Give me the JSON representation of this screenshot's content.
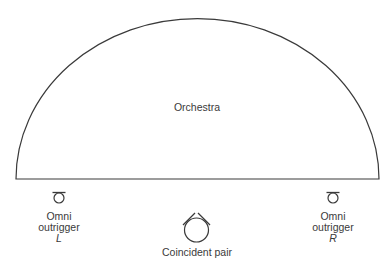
{
  "diagram": {
    "stage": {
      "label": "Orchestra",
      "shape": "semicircle"
    },
    "microphones": {
      "left_outrigger": {
        "line1": "Omni",
        "line2": "outrigger",
        "side": "L",
        "type": "omni-icon"
      },
      "right_outrigger": {
        "line1": "Omni",
        "line2": "outrigger",
        "side": "R",
        "type": "omni-icon"
      },
      "center_pair": {
        "label": "Coincident pair",
        "type": "coincident-pair-icon"
      }
    },
    "colors": {
      "stroke": "#3a3a3a",
      "background": "#ffffff"
    }
  }
}
